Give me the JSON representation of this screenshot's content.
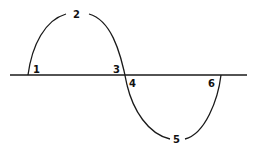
{
  "diagram": {
    "title": "",
    "line_color": "#1a1a1a",
    "points": [
      {
        "id": "p1",
        "label": "1",
        "position": "first axis crossing (rising)"
      },
      {
        "id": "p2",
        "label": "2",
        "position": "positive peak"
      },
      {
        "id": "p3",
        "label": "3",
        "position": "second axis crossing, above axis"
      },
      {
        "id": "p4",
        "label": "4",
        "position": "second axis crossing, below axis"
      },
      {
        "id": "p5",
        "label": "5",
        "position": "negative trough"
      },
      {
        "id": "p6",
        "label": "6",
        "position": "third axis crossing (rising)"
      }
    ]
  }
}
